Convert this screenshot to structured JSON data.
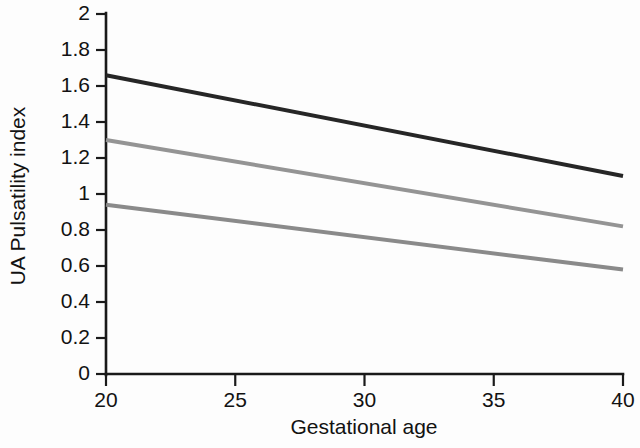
{
  "chart_data": {
    "type": "line",
    "title": "",
    "xlabel": "Gestational age",
    "ylabel": "UA Pulsatility index",
    "xlim": [
      20,
      40
    ],
    "ylim": [
      0,
      2
    ],
    "xticks": [
      20,
      25,
      30,
      35,
      40
    ],
    "yticks": [
      0,
      0.2,
      0.4,
      0.6,
      0.8,
      1,
      1.2,
      1.4,
      1.6,
      1.8,
      2
    ],
    "xtick_labels": [
      "20",
      "25",
      "30",
      "35",
      "40"
    ],
    "ytick_labels": [
      "0",
      "0.2",
      "0.4",
      "0.6",
      "0.8",
      "1",
      "1.2",
      "1.4",
      "1.6",
      "1.8",
      "2"
    ],
    "grid": false,
    "legend": "none",
    "x": [
      20,
      40
    ],
    "series": [
      {
        "name": "upper-curve",
        "color": "#262626",
        "stroke_width": 4.0,
        "values": [
          1.66,
          1.1
        ]
      },
      {
        "name": "middle-curve",
        "color": "#949494",
        "stroke_width": 4.0,
        "values": [
          1.3,
          0.82
        ]
      },
      {
        "name": "lower-curve",
        "color": "#8a8a8a",
        "stroke_width": 4.0,
        "values": [
          0.94,
          0.58
        ]
      }
    ]
  },
  "axes": {
    "x_axis_name": "x-axis",
    "y_axis_name": "y-axis"
  }
}
